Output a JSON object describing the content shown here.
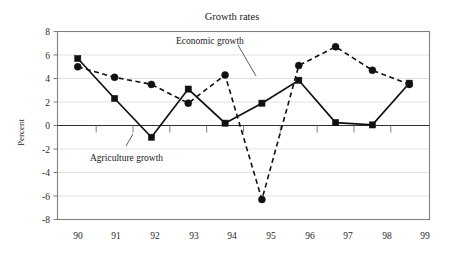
{
  "chart_data": {
    "type": "line",
    "title": "Growth rates",
    "xlabel": "",
    "ylabel": "Percent",
    "categories": [
      "90",
      "91",
      "92",
      "93",
      "94",
      "95",
      "96",
      "97",
      "98",
      "99"
    ],
    "ylim": [
      -8,
      8
    ],
    "yticks": [
      8,
      6,
      4,
      2,
      0,
      -2,
      -4,
      -6,
      -8
    ],
    "ytick_labels": [
      "8",
      "6",
      "4",
      "2",
      "0",
      "-2",
      "-4",
      "-6",
      "-8"
    ],
    "grid": true,
    "legend": "annotations",
    "series": [
      {
        "name": "Economic growth",
        "style": "dashed",
        "marker": "circle",
        "values": [
          5.0,
          4.1,
          3.5,
          1.9,
          4.3,
          -6.3,
          5.1,
          6.7,
          4.7,
          3.5
        ]
      },
      {
        "name": "Agriculture growth",
        "style": "solid",
        "marker": "square",
        "values": [
          5.7,
          2.3,
          -1.0,
          3.1,
          0.2,
          1.9,
          3.85,
          0.25,
          0.05,
          3.6
        ]
      }
    ],
    "annotations": [
      {
        "text": "Economic growth",
        "target_year": "94"
      },
      {
        "text": "Agriculture growth",
        "target_year": "92"
      }
    ]
  },
  "labels": {
    "title": "Growth rates",
    "y_axis_title": "Percent",
    "annotation_economic": "Economic growth",
    "annotation_agriculture": "Agriculture growth"
  },
  "yticks": {
    "t0": "8",
    "t1": "6",
    "t2": "4",
    "t3": "2",
    "t4": "0",
    "t5": "-2",
    "t6": "-4",
    "t7": "-6",
    "t8": "-8"
  },
  "xticks": {
    "t0": "90",
    "t1": "91",
    "t2": "92",
    "t3": "93",
    "t4": "94",
    "t5": "95",
    "t6": "96",
    "t7": "97",
    "t8": "98",
    "t9": "99"
  },
  "colors": {
    "series_line": "#111111",
    "grid": "#d9d9d9",
    "frame": "#808080",
    "text": "#1a1a1a"
  }
}
